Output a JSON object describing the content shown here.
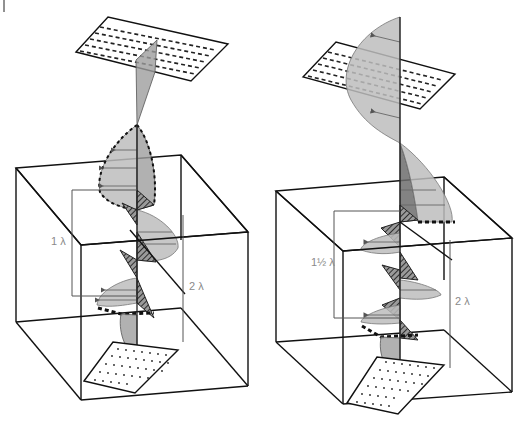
{
  "figure": {
    "corner_mark": "|",
    "colors": {
      "line": "#111111",
      "wave_fill_light": "#bdbdbd",
      "wave_fill_dark": "#6d6d6d",
      "label_text": "#8a8a8a"
    }
  },
  "panels": [
    {
      "id": "left",
      "inner_length_label": "1 λ",
      "outer_length_label": "2 λ",
      "top_plane_pattern": "dashed-horizontal-lines",
      "bottom_plane_pattern": "dotted-diagonal-marks"
    },
    {
      "id": "right",
      "inner_length_label": "1½ λ",
      "outer_length_label": "2 λ",
      "top_plane_pattern": "dashed-horizontal-lines",
      "bottom_plane_pattern": "dotted-diagonal-marks"
    }
  ]
}
